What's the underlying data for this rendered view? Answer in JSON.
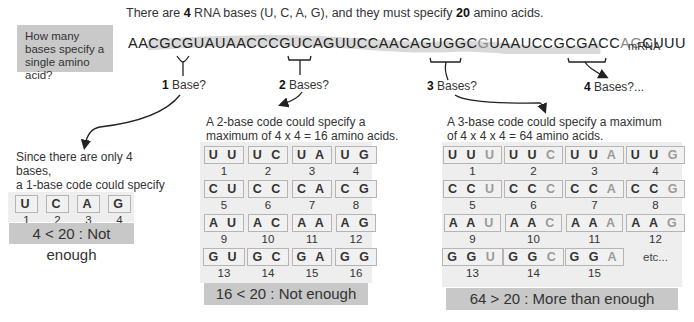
{
  "header": {
    "prefix": "There are ",
    "bases_count": "4",
    "middle": " RNA bases (U, C, A, G), and they must specify ",
    "amino_count": "20",
    "suffix": " amino acids."
  },
  "question": "How many bases specify a single amino acid?",
  "mrna": {
    "sequence_parts": [
      {
        "text": "AACGC",
        "faint": false
      },
      {
        "text": "G",
        "faint": false
      },
      {
        "text": "UAUAACCCGUCAGUUCCAACAGUGGC",
        "faint": false
      },
      {
        "text": "G",
        "faint": true
      },
      {
        "text": "UAAUCCGCGACC",
        "faint": false
      },
      {
        "text": "AG",
        "faint": true
      },
      {
        "text": "CUUU",
        "faint": false
      }
    ],
    "label": "mRNA"
  },
  "questions": {
    "one": {
      "num": "1",
      "text": " Base?"
    },
    "two": {
      "num": "2",
      "text": " Bases?"
    },
    "three": {
      "num": "3",
      "text": " Bases?"
    },
    "four": {
      "num": "4",
      "text": " Bases?..."
    }
  },
  "one_base": {
    "description_lines": [
      "Since there are only 4 bases,",
      "a 1-base code could specify",
      "only 4 amino acids."
    ],
    "codes": [
      {
        "code": "U",
        "n": "1"
      },
      {
        "code": "C",
        "n": "2"
      },
      {
        "code": "A",
        "n": "3"
      },
      {
        "code": "G",
        "n": "4"
      }
    ],
    "result": "4 < 20 : Not enough"
  },
  "two_base": {
    "description_lines": [
      "A 2-base code could specify a",
      "maximum of 4 x 4 = 16 amino acids."
    ],
    "codes": [
      {
        "code": "U U",
        "n": "1"
      },
      {
        "code": "U C",
        "n": "2"
      },
      {
        "code": "U A",
        "n": "3"
      },
      {
        "code": "U G",
        "n": "4"
      },
      {
        "code": "C U",
        "n": "5"
      },
      {
        "code": "C C",
        "n": "6"
      },
      {
        "code": "C A",
        "n": "7"
      },
      {
        "code": "C G",
        "n": "8"
      },
      {
        "code": "A U",
        "n": "9"
      },
      {
        "code": "A C",
        "n": "10"
      },
      {
        "code": "A A",
        "n": "11"
      },
      {
        "code": "A G",
        "n": "12"
      },
      {
        "code": "G U",
        "n": "13"
      },
      {
        "code": "G C",
        "n": "14"
      },
      {
        "code": "G A",
        "n": "15"
      },
      {
        "code": "G G",
        "n": "16"
      }
    ],
    "result": "16 < 20 : Not enough"
  },
  "three_base": {
    "description_lines": [
      "A 3-base code could specify a maximum",
      "of 4 x 4 x 4 = 64 amino acids."
    ],
    "codes": [
      {
        "base": "U U",
        "last": "U",
        "n": "1"
      },
      {
        "base": "U U",
        "last": "C",
        "n": "2"
      },
      {
        "base": "U U",
        "last": "A",
        "n": "3"
      },
      {
        "base": "U U",
        "last": "G",
        "n": "4"
      },
      {
        "base": "C C",
        "last": "U",
        "n": "5"
      },
      {
        "base": "C C",
        "last": "C",
        "n": "6"
      },
      {
        "base": "C C",
        "last": "A",
        "n": "7"
      },
      {
        "base": "C C",
        "last": "G",
        "n": "8"
      },
      {
        "base": "A A",
        "last": "U",
        "n": "9"
      },
      {
        "base": "A A",
        "last": "C",
        "n": "10"
      },
      {
        "base": "A A",
        "last": "A",
        "n": "11"
      },
      {
        "base": "A A",
        "last": "G",
        "n": "12"
      },
      {
        "base": "G G",
        "last": "U",
        "n": "13"
      },
      {
        "base": "G G",
        "last": "C",
        "n": "14"
      },
      {
        "base": "G G",
        "last": "A",
        "n": "15"
      }
    ],
    "etc": "etc...",
    "result": "64 > 20 : More than enough"
  },
  "colors": {
    "panel_bg": "#eeeeee",
    "result_bg": "#c8c8c8",
    "question_bg": "#c9c9c9",
    "mrna_band": "#d8d8d8",
    "faint_base": "#9a9a9a"
  }
}
